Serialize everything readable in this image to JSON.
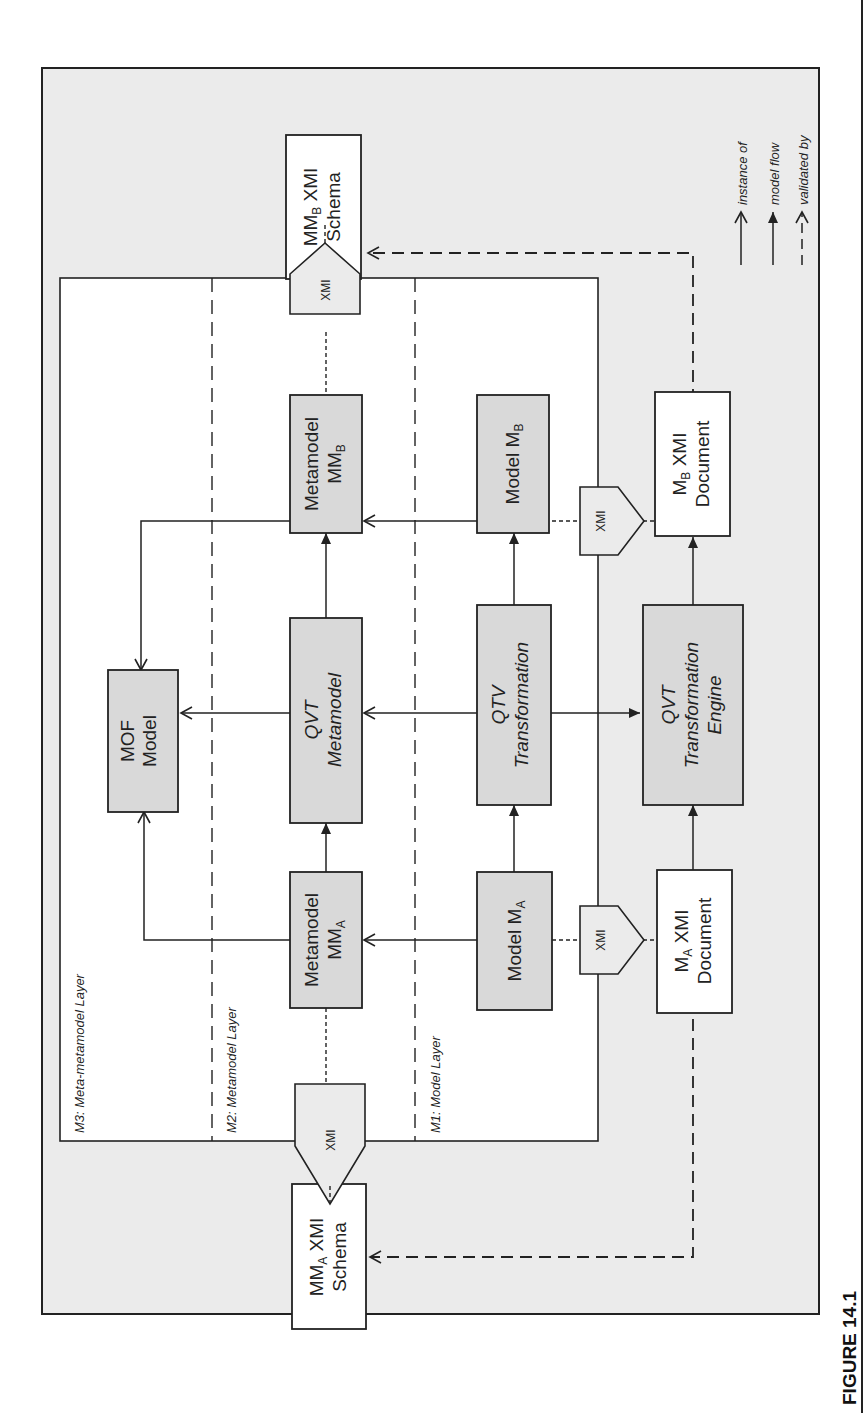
{
  "figure": {
    "caption": "FIGURE 14.1",
    "orientation": "rotated 90° counter-clockwise"
  },
  "layers": {
    "m3": "M3: Meta-metamodel Layer",
    "m2": "M2: Metamodel Layer",
    "m1": "M1: Model Layer"
  },
  "boxes": {
    "mof_model": {
      "line1": "MOF",
      "line2": "Model"
    },
    "qvt_metamodel": {
      "line1": "QVT",
      "line2": "Metamodel"
    },
    "metamodel_mma": {
      "line1": "Metamodel",
      "line2": "MM",
      "sub": "A"
    },
    "metamodel_mmb": {
      "line1": "Metamodel",
      "line2": "MM",
      "sub": "B"
    },
    "model_ma": {
      "line1": "Model M",
      "sub": "A"
    },
    "model_mb": {
      "line1": "Model M",
      "sub": "B"
    },
    "qtv_transformation": {
      "line1": "QTV",
      "line2": "Transformation"
    },
    "qvt_engine": {
      "line1": "QVT",
      "line2": "Transformation",
      "line3": "Engine"
    },
    "ma_document": {
      "pre": "M",
      "sub": "A",
      "post": " XMI",
      "line2": "Document"
    },
    "mb_document": {
      "pre": "M",
      "sub": "B",
      "post": " XMI",
      "line2": "Document"
    },
    "mma_schema": {
      "pre": "MM",
      "sub": "A",
      "post": " XMI",
      "line2": "Schema"
    },
    "mmb_schema": {
      "pre": "MM",
      "sub": "B",
      "post": " XMI",
      "line2": "Schema"
    }
  },
  "xmi_label": "XMI",
  "legend": {
    "instance_of": "instance of",
    "model_flow": "model flow",
    "validated_by": "validated by"
  },
  "colors": {
    "background_outer": "#ebebeb",
    "inner_panel": "#ffffff",
    "box_fill": "#d9d9d9",
    "white_box": "#ffffff",
    "stroke": "#222222"
  }
}
